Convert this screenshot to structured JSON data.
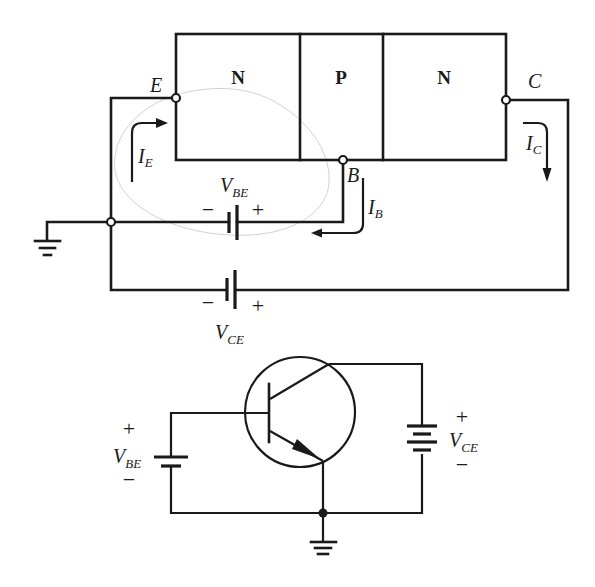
{
  "upper_diagram": {
    "regions": [
      {
        "name": "emitter",
        "label": "N"
      },
      {
        "name": "base",
        "label": "P"
      },
      {
        "name": "collector",
        "label": "N"
      }
    ],
    "terminals": {
      "emitter": "E",
      "base": "B",
      "collector": "C"
    },
    "currents": {
      "emitter": {
        "main": "I",
        "sub": "E"
      },
      "base": {
        "main": "I",
        "sub": "B"
      },
      "collector": {
        "main": "I",
        "sub": "C"
      }
    },
    "sources": {
      "vbe": {
        "main": "V",
        "sub": "BE",
        "neg": "−",
        "pos": "+"
      },
      "vce": {
        "main": "V",
        "sub": "CE",
        "neg": "−",
        "pos": "+"
      }
    }
  },
  "lower_diagram": {
    "transistor": "NPN",
    "sources": {
      "vbe": {
        "main": "V",
        "sub": "BE",
        "pos": "+",
        "neg": "−"
      },
      "vce": {
        "main": "V",
        "sub": "CE",
        "pos": "+",
        "neg": "−"
      }
    }
  },
  "colors": {
    "ink": "#1a1a1a",
    "background": "#ffffff",
    "pencil_mark": "#d2d2d2"
  }
}
